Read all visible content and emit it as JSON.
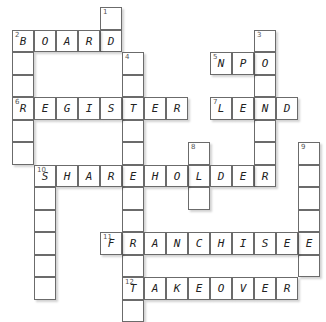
{
  "puzzle": {
    "grid": {
      "origin_x": 12,
      "origin_y": 7,
      "cell_w": 22,
      "cell_h": 22.5
    },
    "colors": {
      "border": "#6b6b6b",
      "background": "#ffffff",
      "text": "#222222"
    },
    "entries": [
      {
        "number": 1,
        "direction": "down",
        "row": 0,
        "col": 4,
        "length": 2,
        "answer": ""
      },
      {
        "number": 2,
        "direction": "across",
        "row": 1,
        "col": 0,
        "length": 5,
        "answer": "BOARD"
      },
      {
        "number": 2,
        "direction": "down",
        "row": 1,
        "col": 0,
        "length": 6,
        "answer": ""
      },
      {
        "number": 3,
        "direction": "down",
        "row": 1,
        "col": 11,
        "length": 7,
        "answer": ""
      },
      {
        "number": 4,
        "direction": "down",
        "row": 2,
        "col": 5,
        "length": 12,
        "answer": ""
      },
      {
        "number": 5,
        "direction": "across",
        "row": 2,
        "col": 9,
        "length": 3,
        "answer": "NPO"
      },
      {
        "number": 6,
        "direction": "across",
        "row": 4,
        "col": 0,
        "length": 8,
        "answer": "REGISTER"
      },
      {
        "number": 7,
        "direction": "across",
        "row": 4,
        "col": 9,
        "length": 4,
        "answer": "LEND"
      },
      {
        "number": 8,
        "direction": "down",
        "row": 6,
        "col": 8,
        "length": 3,
        "answer": ""
      },
      {
        "number": 9,
        "direction": "down",
        "row": 6,
        "col": 13,
        "length": 6,
        "answer": ""
      },
      {
        "number": 10,
        "direction": "across",
        "row": 7,
        "col": 1,
        "length": 11,
        "answer": "SHAREHOLDER"
      },
      {
        "number": 10,
        "direction": "down",
        "row": 7,
        "col": 1,
        "length": 6,
        "answer": ""
      },
      {
        "number": 11,
        "direction": "across",
        "row": 10,
        "col": 4,
        "length": 10,
        "answer": "FRANCHISEE"
      },
      {
        "number": 12,
        "direction": "across",
        "row": 12,
        "col": 5,
        "length": 8,
        "answer": "TAKEOVER"
      }
    ]
  }
}
